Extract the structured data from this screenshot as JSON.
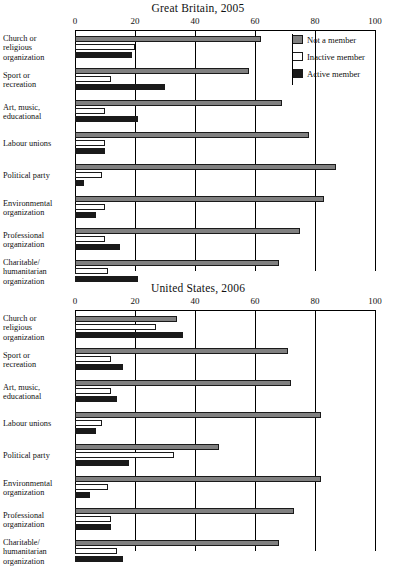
{
  "legend": {
    "position": "top-right",
    "entries": [
      {
        "label": "Not a member",
        "color": "#808080",
        "key": "not_a_member"
      },
      {
        "label": "Inactive member",
        "color": "#ffffff",
        "key": "inactive_member"
      },
      {
        "label": "Active member",
        "color": "#1a1a1a",
        "key": "active_member"
      }
    ]
  },
  "chart_data": [
    {
      "type": "bar",
      "orientation": "horizontal",
      "title": "Great Britain, 2005",
      "xlabel": "",
      "ylabel": "",
      "xlim": [
        0,
        100
      ],
      "xticks": [
        0,
        20,
        40,
        60,
        80,
        100
      ],
      "xticklabels": [
        "0",
        "20",
        "40",
        "60",
        "80",
        "100"
      ],
      "grid": "vertical",
      "categories": [
        "Church or religious organization",
        "Sport or recreation",
        "Art, music, educational",
        "Labour unions",
        "Political party",
        "Environmental organization",
        "Professional organization",
        "Charitable/ humanitarian organization"
      ],
      "series": [
        {
          "name": "Not a member",
          "values": [
            62,
            58,
            69,
            78,
            87,
            83,
            75,
            68
          ]
        },
        {
          "name": "Inactive member",
          "values": [
            20,
            12,
            10,
            10,
            9,
            10,
            10,
            11
          ]
        },
        {
          "name": "Active member",
          "values": [
            19,
            30,
            21,
            10,
            3,
            7,
            15,
            21
          ]
        }
      ]
    },
    {
      "type": "bar",
      "orientation": "horizontal",
      "title": "United States, 2006",
      "xlabel": "",
      "ylabel": "",
      "xlim": [
        0,
        100
      ],
      "xticks": [
        0,
        20,
        40,
        60,
        80,
        100
      ],
      "xticklabels": [
        "0",
        "20",
        "40",
        "60",
        "80",
        "100"
      ],
      "grid": "vertical",
      "categories": [
        "Church or religious organization",
        "Sport or recreation",
        "Art, music, educational",
        "Labour unions",
        "Political party",
        "Environmental organization",
        "Professional organization",
        "Charitable/ humanitarian organization"
      ],
      "series": [
        {
          "name": "Not a member",
          "values": [
            34,
            71,
            72,
            82,
            48,
            82,
            73,
            68
          ]
        },
        {
          "name": "Inactive member",
          "values": [
            27,
            12,
            12,
            9,
            33,
            11,
            12,
            14
          ]
        },
        {
          "name": "Active member",
          "values": [
            36,
            16,
            14,
            7,
            18,
            5,
            12,
            16
          ]
        }
      ]
    }
  ],
  "category_lines": [
    [
      "Church or",
      "religious",
      "organization"
    ],
    [
      "Sport or",
      "recreation"
    ],
    [
      "Art, music,",
      "educational"
    ],
    [
      "Labour unions"
    ],
    [
      "Political party"
    ],
    [
      "Environmental",
      "organization"
    ],
    [
      "Professional",
      "organization"
    ],
    [
      "Charitable/",
      "humanitarian",
      "organization"
    ]
  ]
}
